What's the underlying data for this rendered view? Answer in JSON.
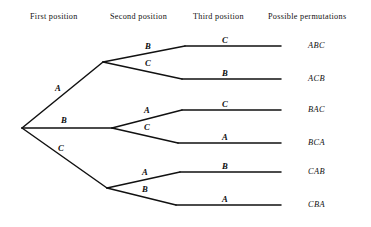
{
  "figure": {
    "type": "tree-diagram",
    "line_color": "#111111",
    "background_color": "#ffffff"
  },
  "headers": [
    {
      "id": "first",
      "label": "First position",
      "x": 30,
      "y": 12
    },
    {
      "id": "second",
      "label": "Second position",
      "x": 110,
      "y": 12
    },
    {
      "id": "third",
      "label": "Third position",
      "x": 193,
      "y": 12
    },
    {
      "id": "permutations",
      "label": "Possible permutations",
      "x": 268,
      "y": 12
    }
  ],
  "nodes": {
    "root": {
      "x": 22,
      "y": 128
    },
    "level1": [
      {
        "id": "n-A",
        "x": 103,
        "y": 62
      },
      {
        "id": "n-B",
        "x": 112,
        "y": 128
      },
      {
        "id": "n-C",
        "x": 107,
        "y": 188
      }
    ],
    "level2_joints": [
      {
        "id": "j-AB",
        "x": 185,
        "y": 46
      },
      {
        "id": "j-AC",
        "x": 182,
        "y": 79
      },
      {
        "id": "j-BA",
        "x": 182,
        "y": 110
      },
      {
        "id": "j-BC",
        "x": 178,
        "y": 143
      },
      {
        "id": "j-CA",
        "x": 180,
        "y": 172
      },
      {
        "id": "j-CB",
        "x": 176,
        "y": 205
      }
    ],
    "line_end_x": 281
  },
  "edge_labels": {
    "level1": [
      {
        "id": "edge-A",
        "label": "A",
        "x": 55,
        "y": 83
      },
      {
        "id": "edge-B",
        "label": "B",
        "x": 61,
        "y": 115
      },
      {
        "id": "edge-C",
        "label": "C",
        "x": 58,
        "y": 143
      }
    ],
    "level2": [
      {
        "id": "edge-A-B",
        "label": "B",
        "x": 145,
        "y": 41
      },
      {
        "id": "edge-A-C",
        "label": "C",
        "x": 145,
        "y": 58
      },
      {
        "id": "edge-B-A",
        "label": "A",
        "x": 144,
        "y": 105
      },
      {
        "id": "edge-B-C",
        "label": "C",
        "x": 144,
        "y": 122
      },
      {
        "id": "edge-C-A",
        "label": "A",
        "x": 142,
        "y": 167
      },
      {
        "id": "edge-C-B",
        "label": "B",
        "x": 142,
        "y": 184
      }
    ],
    "level3": [
      {
        "id": "edge-3-1",
        "label": "C",
        "x": 222,
        "y": 35
      },
      {
        "id": "edge-3-2",
        "label": "B",
        "x": 222,
        "y": 68
      },
      {
        "id": "edge-3-3",
        "label": "C",
        "x": 222,
        "y": 99
      },
      {
        "id": "edge-3-4",
        "label": "A",
        "x": 222,
        "y": 132
      },
      {
        "id": "edge-3-5",
        "label": "B",
        "x": 222,
        "y": 161
      },
      {
        "id": "edge-3-6",
        "label": "A",
        "x": 222,
        "y": 194
      }
    ]
  },
  "permutations": [
    {
      "id": "perm-ABC",
      "label": "ABC",
      "x": 308,
      "y": 41
    },
    {
      "id": "perm-ACB",
      "label": "ACB",
      "x": 308,
      "y": 74
    },
    {
      "id": "perm-BAC",
      "label": "BAC",
      "x": 308,
      "y": 105
    },
    {
      "id": "perm-BCA",
      "label": "BCA",
      "x": 308,
      "y": 138
    },
    {
      "id": "perm-CAB",
      "label": "CAB",
      "x": 308,
      "y": 167
    },
    {
      "id": "perm-CBA",
      "label": "CBA",
      "x": 308,
      "y": 200
    }
  ]
}
